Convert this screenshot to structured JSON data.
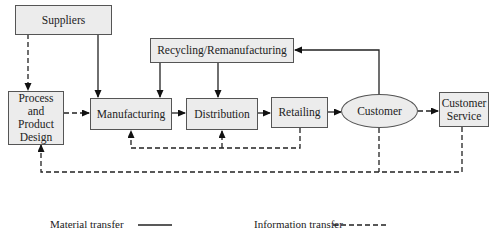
{
  "diagram": {
    "nodes": {
      "suppliers": "Suppliers",
      "recycling": "Recycling/Remanufacturing",
      "design": "Process and Product Design",
      "manufacturing": "Manufacturing",
      "distribution": "Distribution",
      "retailing": "Retailing",
      "customer": "Customer",
      "customer_service": "Customer Service"
    },
    "edges": [
      {
        "from": "Suppliers",
        "to": "Process and Product Design",
        "type": "information"
      },
      {
        "from": "Suppliers",
        "to": "Manufacturing",
        "type": "material"
      },
      {
        "from": "Recycling/Remanufacturing",
        "to": "Manufacturing",
        "type": "material"
      },
      {
        "from": "Recycling/Remanufacturing",
        "to": "Distribution",
        "type": "material"
      },
      {
        "from": "Process and Product Design",
        "to": "Manufacturing",
        "type": "information"
      },
      {
        "from": "Manufacturing",
        "to": "Distribution",
        "type": "material"
      },
      {
        "from": "Distribution",
        "to": "Retailing",
        "type": "material"
      },
      {
        "from": "Retailing",
        "to": "Customer",
        "type": "material"
      },
      {
        "from": "Customer",
        "to": "Recycling/Remanufacturing",
        "type": "material"
      },
      {
        "from": "Customer",
        "to": "Customer Service",
        "type": "information"
      },
      {
        "from": "Retailing",
        "to": "Manufacturing",
        "type": "information"
      },
      {
        "from": "Retailing",
        "to": "Distribution",
        "type": "information"
      },
      {
        "from": "Customer",
        "to": "Process and Product Design",
        "type": "information"
      },
      {
        "from": "Customer Service",
        "to": "Process and Product Design",
        "type": "information"
      }
    ],
    "legend": {
      "material": "Material transfer",
      "information": "Information transfer"
    }
  }
}
